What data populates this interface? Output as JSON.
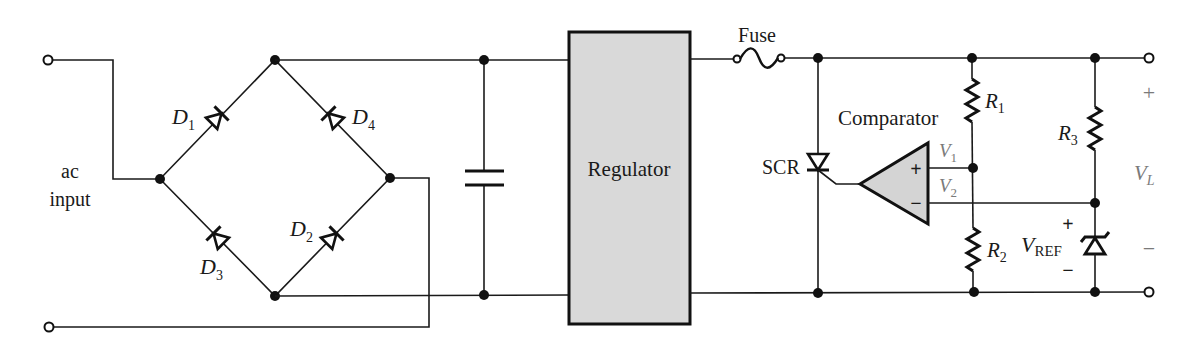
{
  "diagram": {
    "colors": {
      "line": "#1a1a1a",
      "regulator_fill": "#d9d9d9",
      "comparator_fill": "#d4d4d4",
      "faint_label": "#7a7a7a"
    },
    "input": {
      "label_line1": "ac",
      "label_line2": "input"
    },
    "bridge": {
      "diodes": [
        {
          "id": "D1",
          "main": "D",
          "sub": "1"
        },
        {
          "id": "D2",
          "main": "D",
          "sub": "2"
        },
        {
          "id": "D3",
          "main": "D",
          "sub": "3"
        },
        {
          "id": "D4",
          "main": "D",
          "sub": "4"
        }
      ]
    },
    "filter": {
      "component": "capacitor"
    },
    "regulator": {
      "label": "Regulator"
    },
    "fuse": {
      "label": "Fuse"
    },
    "scr": {
      "label": "SCR"
    },
    "comparator": {
      "label": "Comparator",
      "plus": "+",
      "minus": "−"
    },
    "signals": {
      "v1": {
        "main": "V",
        "sub": "1"
      },
      "v2": {
        "main": "V",
        "sub": "2"
      }
    },
    "resistors": [
      {
        "id": "R1",
        "main": "R",
        "sub": "1"
      },
      {
        "id": "R2",
        "main": "R",
        "sub": "2"
      },
      {
        "id": "R3",
        "main": "R",
        "sub": "3"
      }
    ],
    "reference": {
      "main": "V",
      "sub": "REF",
      "plus": "+",
      "minus": "−"
    },
    "output": {
      "main": "V",
      "sub": "L",
      "plus": "+",
      "minus": "−"
    }
  }
}
